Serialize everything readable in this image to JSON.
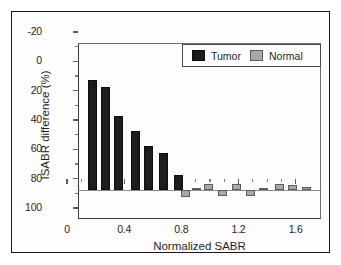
{
  "figure": {
    "background": "#ffffff",
    "frame_color": "#1a1a1a"
  },
  "legend": {
    "position": "top-right",
    "entries": [
      {
        "label": "Tumor",
        "color": "#1d1d1d",
        "swatch": "black-square-swatch"
      },
      {
        "label": "Normal",
        "color": "#a8a8a8",
        "swatch": "gray-square-swatch"
      }
    ]
  },
  "axes": {
    "y_ticks": [
      "100",
      "80",
      "60",
      "40",
      "20",
      "0",
      "-20"
    ],
    "x_ticks": [
      "0",
      "0.4",
      "0.8",
      "1.2",
      "1.6"
    ]
  },
  "chart_data": {
    "type": "bar",
    "title": "",
    "xlabel": "Normalized SABR",
    "ylabel": "ISABR difference (%)",
    "xlim": [
      0,
      1.7
    ],
    "ylim": [
      -20,
      100
    ],
    "y_ticks": [
      -20,
      0,
      20,
      40,
      60,
      80,
      100
    ],
    "x_ticks": [
      0,
      0.4,
      0.8,
      1.2,
      1.6
    ],
    "y_minor_tick_interval": 10,
    "x_minor_tick_interval": 0.1,
    "grid": false,
    "legend_position": "upper right",
    "series": [
      {
        "name": "Tumor",
        "color": "#1d1d1d",
        "points": [
          {
            "x": 0.1,
            "y": 75
          },
          {
            "x": 0.19,
            "y": 70
          },
          {
            "x": 0.28,
            "y": 50
          },
          {
            "x": 0.4,
            "y": 40
          },
          {
            "x": 0.49,
            "y": 30
          },
          {
            "x": 0.6,
            "y": 25
          },
          {
            "x": 0.7,
            "y": 10
          }
        ]
      },
      {
        "name": "Normal",
        "color": "#a8a8a8",
        "points": [
          {
            "x": 0.75,
            "y": -5
          },
          {
            "x": 0.83,
            "y": 1
          },
          {
            "x": 0.91,
            "y": 4
          },
          {
            "x": 1.01,
            "y": -4
          },
          {
            "x": 1.11,
            "y": 4
          },
          {
            "x": 1.21,
            "y": -4
          },
          {
            "x": 1.3,
            "y": 1
          },
          {
            "x": 1.41,
            "y": 4
          },
          {
            "x": 1.5,
            "y": 3
          },
          {
            "x": 1.6,
            "y": 2
          }
        ]
      }
    ]
  }
}
